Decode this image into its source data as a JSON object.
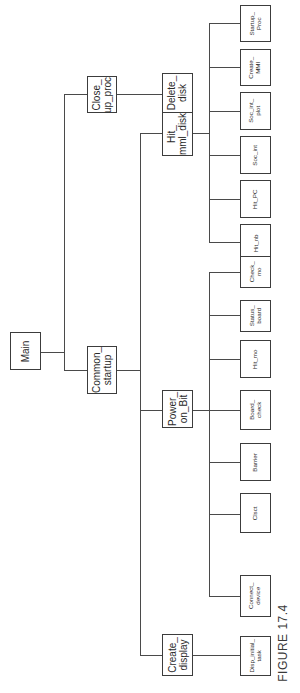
{
  "diagram": {
    "type": "hierarchy-tree",
    "orientation": "rotated-90-ccw",
    "caption": "FIGURE 17.4",
    "line_color": "#4a4a4a",
    "box_border_color": "#3c3c3c",
    "text_color": "#2a2a2a"
  },
  "nodes": {
    "main": {
      "label": "Main",
      "level": 0,
      "children": [
        "close_up_proc",
        "common_startup"
      ]
    },
    "close_up_proc": {
      "label": "Close_\nup_proc",
      "level": 1,
      "children": [
        "delete_disk"
      ]
    },
    "common_startup": {
      "label": "Common_\nstartup",
      "level": 1,
      "children": [
        "hit_mml_disk",
        "power_on_bit",
        "create_display"
      ]
    },
    "delete_disk": {
      "label": "Delete_\ndisk",
      "level": 2,
      "children": []
    },
    "hit_mml_disk": {
      "label": "Hit_\nmml_disk",
      "level": 2,
      "children": [
        "startup_proc",
        "create_mmi",
        "soc_int_plot",
        "soc_int",
        "hit_pc",
        "hit_nb"
      ]
    },
    "power_on_bit": {
      "label": "Power_\non_Bit",
      "level": 2,
      "children": [
        "check_mo",
        "status_board",
        "hit_mo",
        "board_check",
        "barrier",
        "clsct",
        "connect_device"
      ]
    },
    "create_display": {
      "label": "Create_\ndisplay",
      "level": 2,
      "children": [
        "disp_initial_task"
      ]
    },
    "startup_proc": {
      "label": "Startup_\nProc",
      "level": 3,
      "children": []
    },
    "create_mmi": {
      "label": "Create_\nMMI",
      "level": 3,
      "children": []
    },
    "soc_int_plot": {
      "label": "Soc_int_\nplot",
      "level": 3,
      "children": []
    },
    "soc_int": {
      "label": "Soc_int",
      "level": 3,
      "children": []
    },
    "hit_pc": {
      "label": "Hit_PC",
      "level": 3,
      "children": []
    },
    "hit_nb": {
      "label": "Hit_nb",
      "level": 3,
      "children": []
    },
    "check_mo": {
      "label": "Check_\nmo",
      "level": 3,
      "children": []
    },
    "status_board": {
      "label": "Status_\nboard",
      "level": 3,
      "children": []
    },
    "hit_mo": {
      "label": "Hit_mo",
      "level": 3,
      "children": []
    },
    "board_check": {
      "label": "Board_\ncheck",
      "level": 3,
      "children": []
    },
    "barrier": {
      "label": "Barrier",
      "level": 3,
      "children": []
    },
    "clsct": {
      "label": "Clsct",
      "level": 3,
      "children": []
    },
    "connect_device": {
      "label": "Connect_\ndevice",
      "level": 3,
      "children": []
    },
    "disp_initial_task": {
      "label": "Disp_initial_\ntask",
      "level": 3,
      "children": []
    }
  },
  "edges": [
    [
      "main",
      "close_up_proc"
    ],
    [
      "main",
      "common_startup"
    ],
    [
      "close_up_proc",
      "delete_disk"
    ],
    [
      "common_startup",
      "hit_mml_disk"
    ],
    [
      "common_startup",
      "power_on_bit"
    ],
    [
      "common_startup",
      "create_display"
    ],
    [
      "hit_mml_disk",
      "startup_proc"
    ],
    [
      "hit_mml_disk",
      "create_mmi"
    ],
    [
      "hit_mml_disk",
      "soc_int_plot"
    ],
    [
      "hit_mml_disk",
      "soc_int"
    ],
    [
      "hit_mml_disk",
      "hit_pc"
    ],
    [
      "hit_mml_disk",
      "hit_nb"
    ],
    [
      "power_on_bit",
      "check_mo"
    ],
    [
      "power_on_bit",
      "status_board"
    ],
    [
      "power_on_bit",
      "hit_mo"
    ],
    [
      "power_on_bit",
      "board_check"
    ],
    [
      "power_on_bit",
      "barrier"
    ],
    [
      "power_on_bit",
      "clsct"
    ],
    [
      "power_on_bit",
      "connect_device"
    ],
    [
      "create_display",
      "disp_initial_task"
    ]
  ]
}
